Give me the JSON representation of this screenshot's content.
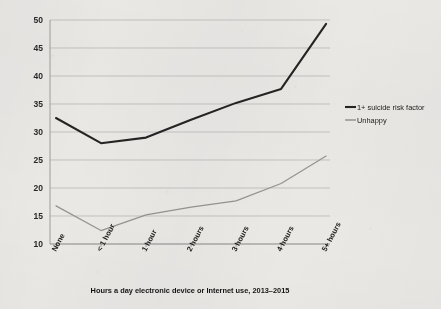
{
  "chart_data": {
    "type": "line",
    "title": "",
    "xlabel": "Hours a day electronic device or Internet use, 2013–2015",
    "ylabel": "",
    "categories": [
      "None",
      "< 1 hour",
      "1 hour",
      "2 hours",
      "3 hours",
      "4 hours",
      "5+ hours"
    ],
    "series": [
      {
        "name": "1+ suicide risk factor",
        "color": "#262626",
        "values": [
          32.5,
          28.0,
          29.0,
          32.2,
          35.2,
          37.7,
          49.3
        ]
      },
      {
        "name": "Unhappy",
        "color": "#9a9a9a",
        "values": [
          16.8,
          12.4,
          15.2,
          16.6,
          17.7,
          20.8,
          25.7
        ]
      }
    ],
    "ylim": [
      10,
      50
    ],
    "yticks": [
      10,
      15,
      20,
      25,
      30,
      35,
      40,
      45,
      50
    ],
    "ytick_labels": [
      "10",
      "15",
      "20",
      "25",
      "30",
      "35",
      "40",
      "45",
      "50"
    ],
    "grid": true,
    "legend_position": "right"
  },
  "legend": {
    "entries": [
      {
        "label": "1+ suicide risk factor"
      },
      {
        "label": "Unhappy"
      }
    ]
  }
}
